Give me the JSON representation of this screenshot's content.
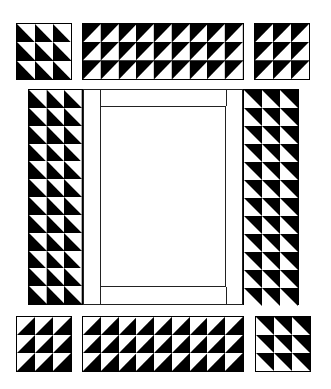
{
  "canvas": {
    "width": 331,
    "height": 389,
    "background": "#ffffff"
  },
  "colors": {
    "dark": "#000000",
    "light": "#ffffff",
    "line": "#222222"
  },
  "blocks": [
    {
      "id": "top-left",
      "x": 16,
      "y": 23,
      "w": 56,
      "h": 57,
      "cols": 3,
      "rows": 3,
      "white": "upper-right"
    },
    {
      "id": "top-middle",
      "x": 82,
      "y": 23,
      "w": 162,
      "h": 57,
      "cols": 9,
      "rows": 3,
      "white": "lower-right"
    },
    {
      "id": "top-right",
      "x": 254,
      "y": 23,
      "w": 56,
      "h": 57,
      "cols": 3,
      "rows": 3,
      "white": "lower-right"
    },
    {
      "id": "left-column",
      "x": 28,
      "y": 89,
      "w": 55,
      "h": 216,
      "cols": 3,
      "rows": 12,
      "white": "upper-right"
    },
    {
      "id": "right-column",
      "x": 243,
      "y": 89,
      "w": 56,
      "h": 216,
      "cols": 3,
      "rows": 12,
      "white": "lower-left"
    },
    {
      "id": "bottom-left",
      "x": 16,
      "y": 316,
      "w": 56,
      "h": 56,
      "cols": 3,
      "rows": 3,
      "white": "upper-left"
    },
    {
      "id": "bottom-middle",
      "x": 82,
      "y": 316,
      "w": 162,
      "h": 56,
      "cols": 9,
      "rows": 3,
      "white": "upper-left"
    },
    {
      "id": "bottom-right",
      "x": 255,
      "y": 316,
      "w": 56,
      "h": 56,
      "cols": 3,
      "rows": 3,
      "white": "lower-left"
    }
  ],
  "center": {
    "label": ""
  }
}
